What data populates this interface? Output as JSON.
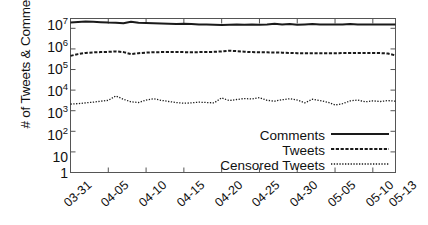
{
  "chart_data": {
    "type": "line",
    "title": "",
    "xlabel": "",
    "ylabel": "# of Tweets & Comments",
    "yscale": "log",
    "ylim": [
      1,
      30000000
    ],
    "ytick_labels": [
      "10^7",
      "10^6",
      "10^5",
      "10^4",
      "10^3",
      "10^2",
      "10",
      "1"
    ],
    "ytick_mantissa": [
      "10",
      "10",
      "10",
      "10",
      "10",
      "10",
      "10",
      "1"
    ],
    "ytick_exponent": [
      "7",
      "6",
      "5",
      "4",
      "3",
      "2",
      "",
      ""
    ],
    "ytick_values": [
      10000000,
      1000000,
      100000,
      10000,
      1000,
      100,
      10,
      1
    ],
    "grid": false,
    "legend_position": "lower-right",
    "xtick_labels": [
      "03-31",
      "04-05",
      "04-10",
      "04-15",
      "04-20",
      "04-25",
      "04-30",
      "05-05",
      "05-10",
      "05-13"
    ],
    "x_start": "03-31",
    "x_end": "05-13",
    "categories": [
      "03-31",
      "04-01",
      "04-02",
      "04-03",
      "04-04",
      "04-05",
      "04-06",
      "04-07",
      "04-08",
      "04-09",
      "04-10",
      "04-11",
      "04-12",
      "04-13",
      "04-14",
      "04-15",
      "04-16",
      "04-17",
      "04-18",
      "04-19",
      "04-20",
      "04-21",
      "04-22",
      "04-23",
      "04-24",
      "04-25",
      "04-26",
      "04-27",
      "04-28",
      "04-29",
      "04-30",
      "05-01",
      "05-02",
      "05-03",
      "05-04",
      "05-05",
      "05-06",
      "05-07",
      "05-08",
      "05-09",
      "05-10",
      "05-11",
      "05-12",
      "05-13"
    ],
    "series": [
      {
        "name": "Comments",
        "style": "solid",
        "color": "#1a1a1a",
        "values": [
          19000000,
          20500000,
          21500000,
          21000000,
          20000000,
          19000000,
          18500000,
          17500000,
          21000000,
          18500000,
          18000000,
          17500000,
          17000000,
          16500000,
          16000000,
          16500000,
          16000000,
          15500000,
          15500000,
          15000000,
          14500000,
          15000000,
          15500000,
          15000000,
          15500000,
          15000000,
          15500000,
          16500000,
          15500000,
          16000000,
          15000000,
          15500000,
          16000000,
          15500000,
          15500000,
          15500000,
          15500000,
          16000000,
          15500000,
          15500000,
          15500000,
          15500000,
          15500000,
          15500000
        ]
      },
      {
        "name": "Tweets",
        "style": "dashed",
        "color": "#1a1a1a",
        "values": [
          460000,
          560000,
          640000,
          680000,
          700000,
          720000,
          760000,
          700000,
          560000,
          620000,
          660000,
          690000,
          700000,
          700000,
          710000,
          700000,
          690000,
          700000,
          710000,
          720000,
          760000,
          820000,
          780000,
          730000,
          700000,
          690000,
          680000,
          670000,
          660000,
          640000,
          620000,
          610000,
          620000,
          620000,
          620000,
          620000,
          630000,
          630000,
          640000,
          640000,
          640000,
          630000,
          600000,
          480000
        ]
      },
      {
        "name": "Censored Tweets",
        "style": "dotted",
        "color": "#1a1a1a",
        "values": [
          2100,
          2200,
          2400,
          2600,
          2900,
          3200,
          5200,
          3600,
          2700,
          2500,
          3300,
          3800,
          3200,
          2800,
          2500,
          2300,
          2400,
          2600,
          2500,
          2400,
          4200,
          3100,
          3500,
          3900,
          3700,
          4300,
          3200,
          2900,
          3400,
          3800,
          3300,
          2400,
          3600,
          3100,
          2600,
          1900,
          2200,
          3000,
          3300,
          2700,
          3000,
          2800,
          3100,
          2900
        ]
      }
    ],
    "legend": [
      {
        "label": "Comments",
        "style": "solid"
      },
      {
        "label": "Tweets",
        "style": "dashed"
      },
      {
        "label": "Censored Tweets",
        "style": "dotted"
      }
    ]
  }
}
